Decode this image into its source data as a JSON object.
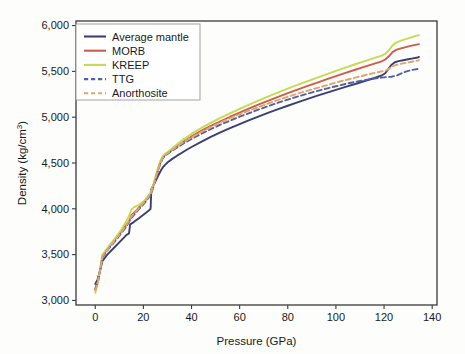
{
  "chart_data": {
    "type": "line",
    "title": "",
    "xlabel": "Pressure (GPa)",
    "ylabel": "Density (kg/cm3)",
    "ylabel_display": "Density (kg/cm",
    "ylabel_sup": "3",
    "ylabel_tail": ")",
    "xlim": [
      -8,
      142
    ],
    "ylim": [
      2950,
      6050
    ],
    "xticks": [
      0,
      20,
      40,
      60,
      80,
      100,
      120,
      140
    ],
    "xticklabels": [
      "0",
      "20",
      "40",
      "60",
      "80",
      "100",
      "120",
      "140"
    ],
    "yticks": [
      3000,
      3500,
      4000,
      4500,
      5000,
      5500,
      6000
    ],
    "yticklabels": [
      "3,000",
      "3,500",
      "4,000",
      "4,500",
      "5,000",
      "5,500",
      "6,000"
    ],
    "grid": false,
    "legend_position": "upper left",
    "series": [
      {
        "name": "Average mantle",
        "color": "#3b3f72",
        "dash": "none",
        "points": [
          [
            0,
            3180
          ],
          [
            1,
            3230
          ],
          [
            2,
            3330
          ],
          [
            3,
            3430
          ],
          [
            5,
            3500
          ],
          [
            8,
            3580
          ],
          [
            11,
            3660
          ],
          [
            13,
            3715
          ],
          [
            14,
            3730
          ],
          [
            14.5,
            3830
          ],
          [
            16,
            3855
          ],
          [
            18,
            3895
          ],
          [
            20,
            3935
          ],
          [
            22,
            3975
          ],
          [
            23,
            4000
          ],
          [
            23.3,
            4215
          ],
          [
            24,
            4250
          ],
          [
            25,
            4300
          ],
          [
            26,
            4355
          ],
          [
            27,
            4405
          ],
          [
            28,
            4450
          ],
          [
            29,
            4480
          ],
          [
            30,
            4505
          ],
          [
            32,
            4545
          ],
          [
            34,
            4580
          ],
          [
            36,
            4612
          ],
          [
            38,
            4645
          ],
          [
            40,
            4675
          ],
          [
            44,
            4730
          ],
          [
            48,
            4785
          ],
          [
            52,
            4835
          ],
          [
            56,
            4880
          ],
          [
            60,
            4925
          ],
          [
            64,
            4968
          ],
          [
            68,
            5010
          ],
          [
            72,
            5050
          ],
          [
            76,
            5088
          ],
          [
            80,
            5125
          ],
          [
            84,
            5162
          ],
          [
            88,
            5198
          ],
          [
            92,
            5232
          ],
          [
            96,
            5265
          ],
          [
            100,
            5298
          ],
          [
            104,
            5330
          ],
          [
            108,
            5362
          ],
          [
            112,
            5395
          ],
          [
            116,
            5428
          ],
          [
            119,
            5455
          ],
          [
            120.5,
            5480
          ],
          [
            121.5,
            5515
          ],
          [
            123,
            5570
          ],
          [
            124.5,
            5600
          ],
          [
            126,
            5612
          ],
          [
            128,
            5622
          ],
          [
            130,
            5632
          ],
          [
            132,
            5642
          ],
          [
            134,
            5652
          ],
          [
            134.5,
            5658
          ]
        ]
      },
      {
        "name": "MORB",
        "color": "#cf5c4a",
        "dash": "none",
        "points": [
          [
            0,
            3130
          ],
          [
            1,
            3200
          ],
          [
            2,
            3330
          ],
          [
            3,
            3490
          ],
          [
            5,
            3560
          ],
          [
            8,
            3660
          ],
          [
            11,
            3760
          ],
          [
            13,
            3830
          ],
          [
            14,
            3860
          ],
          [
            15,
            3930
          ],
          [
            17,
            3980
          ],
          [
            19,
            4040
          ],
          [
            21,
            4100
          ],
          [
            23,
            4170
          ],
          [
            24,
            4240
          ],
          [
            25,
            4330
          ],
          [
            26,
            4420
          ],
          [
            27,
            4500
          ],
          [
            28,
            4555
          ],
          [
            29,
            4590
          ],
          [
            30,
            4605
          ],
          [
            32,
            4645
          ],
          [
            34,
            4685
          ],
          [
            36,
            4720
          ],
          [
            38,
            4755
          ],
          [
            40,
            4790
          ],
          [
            44,
            4850
          ],
          [
            48,
            4905
          ],
          [
            52,
            4955
          ],
          [
            56,
            5005
          ],
          [
            60,
            5050
          ],
          [
            64,
            5095
          ],
          [
            68,
            5140
          ],
          [
            72,
            5182
          ],
          [
            76,
            5222
          ],
          [
            80,
            5262
          ],
          [
            84,
            5300
          ],
          [
            88,
            5338
          ],
          [
            92,
            5375
          ],
          [
            96,
            5412
          ],
          [
            100,
            5448
          ],
          [
            104,
            5483
          ],
          [
            108,
            5518
          ],
          [
            112,
            5552
          ],
          [
            116,
            5585
          ],
          [
            119,
            5610
          ],
          [
            120.5,
            5630
          ],
          [
            122,
            5665
          ],
          [
            123.5,
            5710
          ],
          [
            125,
            5735
          ],
          [
            127,
            5752
          ],
          [
            129,
            5765
          ],
          [
            131,
            5778
          ],
          [
            133,
            5790
          ],
          [
            134.5,
            5798
          ]
        ]
      },
      {
        "name": "KREEP",
        "color": "#c3dc52",
        "dash": "none",
        "points": [
          [
            0,
            3080
          ],
          [
            1,
            3180
          ],
          [
            2,
            3340
          ],
          [
            3,
            3500
          ],
          [
            5,
            3570
          ],
          [
            8,
            3670
          ],
          [
            11,
            3780
          ],
          [
            13,
            3870
          ],
          [
            14,
            3920
          ],
          [
            15,
            3990
          ],
          [
            16,
            4015
          ],
          [
            18,
            4040
          ],
          [
            20,
            4080
          ],
          [
            22,
            4135
          ],
          [
            23,
            4180
          ],
          [
            24,
            4250
          ],
          [
            25,
            4345
          ],
          [
            26,
            4440
          ],
          [
            27,
            4520
          ],
          [
            28,
            4575
          ],
          [
            29,
            4600
          ],
          [
            30,
            4618
          ],
          [
            32,
            4662
          ],
          [
            34,
            4705
          ],
          [
            36,
            4745
          ],
          [
            38,
            4782
          ],
          [
            40,
            4818
          ],
          [
            44,
            4880
          ],
          [
            48,
            4938
          ],
          [
            52,
            4992
          ],
          [
            56,
            5042
          ],
          [
            60,
            5090
          ],
          [
            64,
            5138
          ],
          [
            68,
            5183
          ],
          [
            72,
            5228
          ],
          [
            76,
            5270
          ],
          [
            80,
            5312
          ],
          [
            84,
            5352
          ],
          [
            88,
            5392
          ],
          [
            92,
            5430
          ],
          [
            96,
            5468
          ],
          [
            100,
            5505
          ],
          [
            104,
            5542
          ],
          [
            108,
            5578
          ],
          [
            112,
            5613
          ],
          [
            116,
            5648
          ],
          [
            119,
            5672
          ],
          [
            120.5,
            5692
          ],
          [
            122,
            5730
          ],
          [
            123.5,
            5782
          ],
          [
            125,
            5815
          ],
          [
            127,
            5835
          ],
          [
            129,
            5852
          ],
          [
            131,
            5868
          ],
          [
            133,
            5885
          ],
          [
            134.5,
            5895
          ]
        ]
      },
      {
        "name": "TTG",
        "color": "#5160a8",
        "dash": "dashed",
        "points": [
          [
            0,
            3120
          ],
          [
            1,
            3190
          ],
          [
            2,
            3320
          ],
          [
            3,
            3470
          ],
          [
            5,
            3545
          ],
          [
            8,
            3640
          ],
          [
            11,
            3740
          ],
          [
            13,
            3810
          ],
          [
            15,
            3900
          ],
          [
            17,
            3960
          ],
          [
            19,
            4020
          ],
          [
            21,
            4080
          ],
          [
            23,
            4150
          ],
          [
            24,
            4225
          ],
          [
            25,
            4315
          ],
          [
            26,
            4410
          ],
          [
            27,
            4490
          ],
          [
            28,
            4548
          ],
          [
            29,
            4582
          ],
          [
            30,
            4598
          ],
          [
            32,
            4635
          ],
          [
            34,
            4670
          ],
          [
            36,
            4702
          ],
          [
            38,
            4733
          ],
          [
            40,
            4762
          ],
          [
            44,
            4818
          ],
          [
            48,
            4870
          ],
          [
            52,
            4918
          ],
          [
            56,
            4963
          ],
          [
            60,
            5005
          ],
          [
            64,
            5045
          ],
          [
            68,
            5085
          ],
          [
            72,
            5122
          ],
          [
            76,
            5158
          ],
          [
            80,
            5192
          ],
          [
            84,
            5225
          ],
          [
            88,
            5255
          ],
          [
            92,
            5285
          ],
          [
            96,
            5312
          ],
          [
            100,
            5338
          ],
          [
            104,
            5363
          ],
          [
            108,
            5385
          ],
          [
            112,
            5405
          ],
          [
            116,
            5422
          ],
          [
            119,
            5432
          ],
          [
            121,
            5438
          ],
          [
            123,
            5442
          ],
          [
            125,
            5452
          ],
          [
            127,
            5475
          ],
          [
            129,
            5498
          ],
          [
            131,
            5512
          ],
          [
            133,
            5522
          ],
          [
            134.5,
            5528
          ]
        ]
      },
      {
        "name": "Anorthosite",
        "color": "#e2a46a",
        "dash": "dashed",
        "points": [
          [
            0,
            3110
          ],
          [
            1,
            3185
          ],
          [
            2,
            3325
          ],
          [
            3,
            3480
          ],
          [
            5,
            3552
          ],
          [
            8,
            3650
          ],
          [
            11,
            3750
          ],
          [
            13,
            3822
          ],
          [
            15,
            3915
          ],
          [
            17,
            3972
          ],
          [
            19,
            4032
          ],
          [
            21,
            4092
          ],
          [
            23,
            4162
          ],
          [
            24,
            4235
          ],
          [
            25,
            4325
          ],
          [
            26,
            4418
          ],
          [
            27,
            4498
          ],
          [
            28,
            4555
          ],
          [
            29,
            4588
          ],
          [
            30,
            4605
          ],
          [
            32,
            4645
          ],
          [
            34,
            4682
          ],
          [
            36,
            4716
          ],
          [
            38,
            4748
          ],
          [
            40,
            4780
          ],
          [
            44,
            4838
          ],
          [
            48,
            4892
          ],
          [
            52,
            4942
          ],
          [
            56,
            4988
          ],
          [
            60,
            5032
          ],
          [
            64,
            5072
          ],
          [
            68,
            5112
          ],
          [
            72,
            5150
          ],
          [
            76,
            5188
          ],
          [
            80,
            5222
          ],
          [
            84,
            5256
          ],
          [
            88,
            5288
          ],
          [
            92,
            5318
          ],
          [
            96,
            5348
          ],
          [
            100,
            5378
          ],
          [
            104,
            5405
          ],
          [
            108,
            5432
          ],
          [
            112,
            5458
          ],
          [
            116,
            5483
          ],
          [
            119,
            5500
          ],
          [
            121,
            5512
          ],
          [
            122.5,
            5535
          ],
          [
            124,
            5562
          ],
          [
            126,
            5578
          ],
          [
            128,
            5588
          ],
          [
            130,
            5598
          ],
          [
            132,
            5608
          ],
          [
            134,
            5618
          ],
          [
            134.5,
            5622
          ]
        ]
      }
    ]
  },
  "legend": {
    "entries": [
      {
        "label": "Average mantle",
        "color": "#3b3f72",
        "dash": "none"
      },
      {
        "label": "MORB",
        "color": "#cf5c4a",
        "dash": "none"
      },
      {
        "label": "KREEP",
        "color": "#c3dc52",
        "dash": "none"
      },
      {
        "label": "TTG",
        "color": "#5160a8",
        "dash": "dashed"
      },
      {
        "label": "Anorthosite",
        "color": "#e2a46a",
        "dash": "dashed"
      }
    ]
  }
}
